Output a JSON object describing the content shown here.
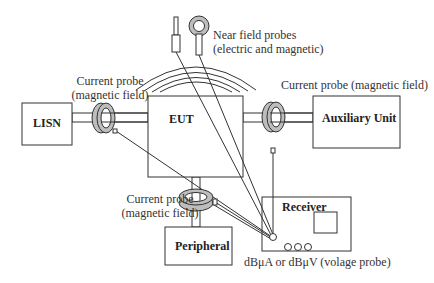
{
  "diagram": {
    "type": "EMC test setup",
    "colors": {
      "line": "#333333",
      "probe_fill": "#bdbdbd",
      "background": "#ffffff"
    },
    "boxes": {
      "lisn": "LISN",
      "eut": "EUT",
      "auxiliary": "Auxiliary Unit",
      "peripheral": "Peripheral",
      "receiver": "Receiver"
    },
    "labels": {
      "left_probe_line1": "Current probe",
      "left_probe_line2": "(magnetic field)",
      "right_probe": "Current probe (magnetic field)",
      "bottom_probe_line1": "Current probe",
      "bottom_probe_line2": "(magnetic field)",
      "near_field_line1": "Near field probes",
      "near_field_line2": "(electric and magnetic)",
      "receiver_units": "dBμA  or dBμV (volage probe)"
    },
    "icons": {
      "current_probe": "toroid-clamp-icon",
      "near_field_electric": "rod-probe-icon",
      "near_field_magnetic": "loop-probe-icon",
      "emission_waves": "radiation-arcs-icon",
      "receiver_screen": "display-icon",
      "receiver_knobs": "knob-icon"
    }
  }
}
